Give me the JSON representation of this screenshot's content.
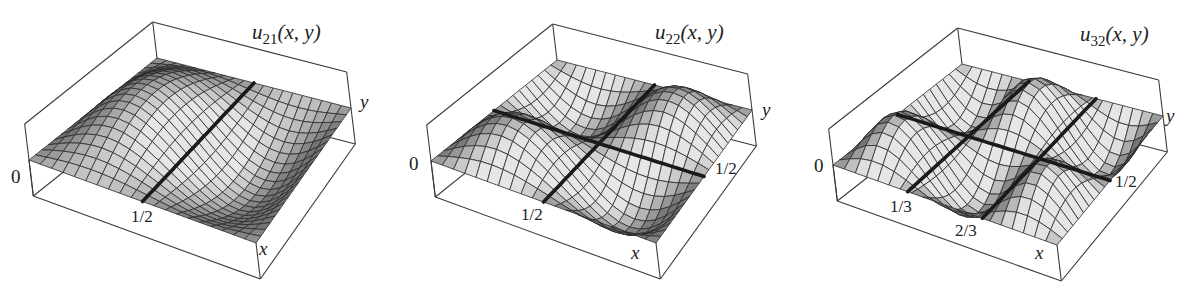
{
  "chart_data": [
    {
      "type": "surface",
      "title": "u21(x, y)",
      "function": "sin(2*pi*x) * sin(1*pi*y)",
      "mode": {
        "n": 2,
        "m": 1
      },
      "xlabel": "x",
      "ylabel": "y",
      "zlabel_tick": "0",
      "x_range": [
        0,
        1
      ],
      "y_range": [
        0,
        1
      ],
      "x_ticks": [
        {
          "value": 0.5,
          "label": "1/2"
        }
      ],
      "y_ticks": [],
      "nodal_lines": [
        {
          "axis": "x",
          "value": 0.5
        }
      ],
      "grid_resolution": 20
    },
    {
      "type": "surface",
      "title": "u22(x, y)",
      "function": "sin(2*pi*x) * sin(2*pi*y)",
      "mode": {
        "n": 2,
        "m": 2
      },
      "xlabel": "x",
      "ylabel": "y",
      "zlabel_tick": "0",
      "x_range": [
        0,
        1
      ],
      "y_range": [
        0,
        1
      ],
      "x_ticks": [
        {
          "value": 0.5,
          "label": "1/2"
        }
      ],
      "y_ticks": [
        {
          "value": 0.5,
          "label": "1/2"
        }
      ],
      "nodal_lines": [
        {
          "axis": "x",
          "value": 0.5
        },
        {
          "axis": "y",
          "value": 0.5
        }
      ],
      "grid_resolution": 20
    },
    {
      "type": "surface",
      "title": "u32(x, y)",
      "function": "sin(3*pi*x) * sin(2*pi*y)",
      "mode": {
        "n": 3,
        "m": 2
      },
      "xlabel": "x",
      "ylabel": "y",
      "zlabel_tick": "0",
      "x_range": [
        0,
        1
      ],
      "y_range": [
        0,
        1
      ],
      "x_ticks": [
        {
          "value": 0.3333,
          "label": "1/3"
        },
        {
          "value": 0.6667,
          "label": "2/3"
        }
      ],
      "y_ticks": [
        {
          "value": 0.5,
          "label": "1/2"
        }
      ],
      "nodal_lines": [
        {
          "axis": "x",
          "value": 0.3333
        },
        {
          "axis": "x",
          "value": 0.6667
        },
        {
          "axis": "y",
          "value": 0.5
        }
      ],
      "grid_resolution": 20
    }
  ],
  "panels": [
    {
      "title_main": "u",
      "title_sub": "21",
      "title_args": "(x, y)",
      "zero": "0",
      "x": "x",
      "y": "y",
      "ticks": [
        "1/2"
      ],
      "yticks": []
    },
    {
      "title_main": "u",
      "title_sub": "22",
      "title_args": "(x, y)",
      "zero": "0",
      "x": "x",
      "y": "y",
      "ticks": [
        "1/2"
      ],
      "yticks": [
        "1/2"
      ]
    },
    {
      "title_main": "u",
      "title_sub": "32",
      "title_args": "(x, y)",
      "zero": "0",
      "x": "x",
      "y": "y",
      "ticks": [
        "1/3",
        "2/3"
      ],
      "yticks": [
        "1/2"
      ]
    }
  ],
  "colors": {
    "box_line": "#3a3a3a",
    "mesh_line": "#2b2b2b",
    "nodal_line": "#1a1a1a",
    "surface_light": "#d8d8d8",
    "surface_dark": "#8c8c8c"
  }
}
